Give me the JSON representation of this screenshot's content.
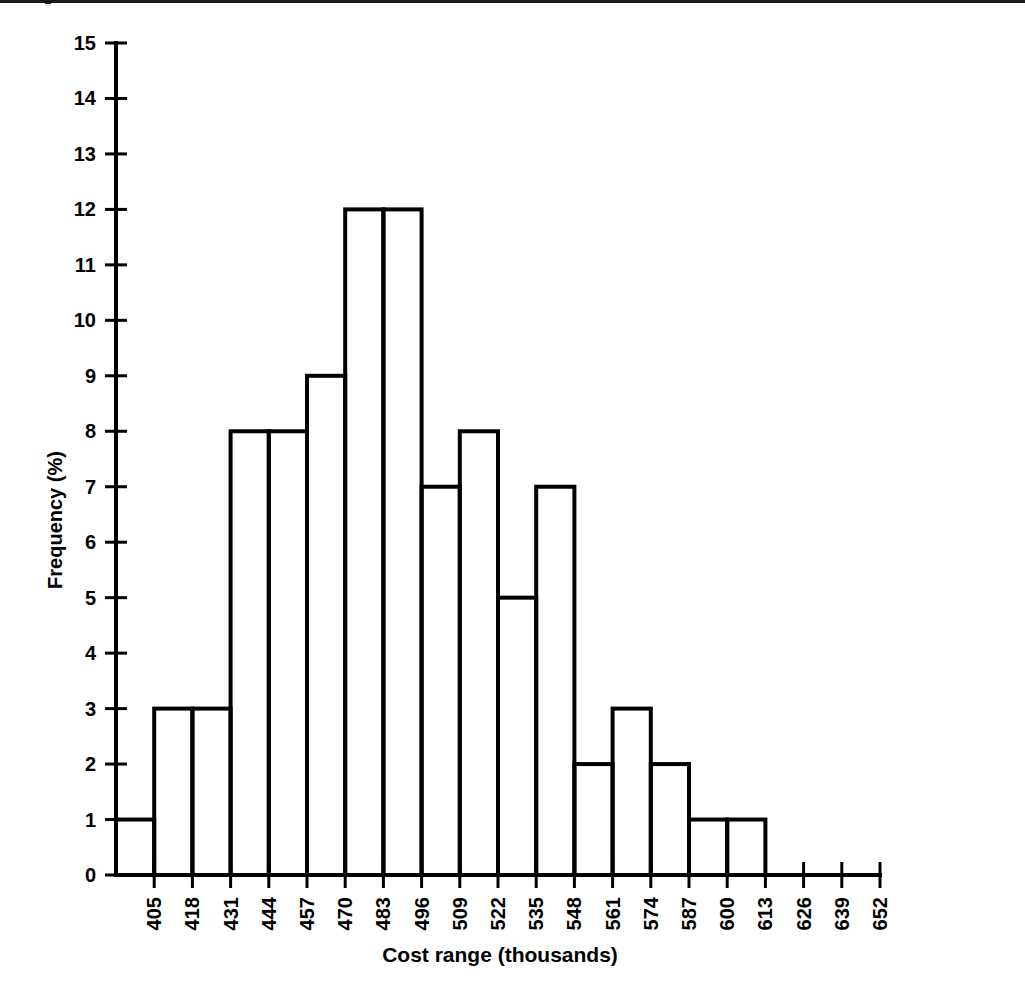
{
  "chart_data": {
    "type": "bar",
    "title": "",
    "xlabel": "Cost range  (thousands)",
    "ylabel": "Frequency (%)",
    "ylim": [
      0,
      15
    ],
    "ytick_labels": [
      "0",
      "1",
      "2",
      "3",
      "4",
      "5",
      "6",
      "7",
      "8",
      "9",
      "10",
      "11",
      "12",
      "13",
      "14",
      "15"
    ],
    "ytick_values": [
      0,
      1,
      2,
      3,
      4,
      5,
      6,
      7,
      8,
      9,
      10,
      11,
      12,
      13,
      14,
      15
    ],
    "xtick_labels": [
      "405",
      "418",
      "431",
      "444",
      "457",
      "470",
      "483",
      "496",
      "509",
      "522",
      "535",
      "548",
      "561",
      "574",
      "587",
      "600",
      "613",
      "626",
      "639",
      "652"
    ],
    "xtick_values": [
      405,
      418,
      431,
      444,
      457,
      470,
      483,
      496,
      509,
      522,
      535,
      548,
      561,
      574,
      587,
      600,
      613,
      626,
      639,
      652
    ],
    "bin_width": 13,
    "bin_edges": [
      392,
      405,
      418,
      431,
      444,
      457,
      470,
      483,
      496,
      509,
      522,
      535,
      548,
      561,
      574,
      587,
      600,
      613,
      626,
      639,
      652
    ],
    "categories": [
      "392-405",
      "405-418",
      "418-431",
      "431-444",
      "444-457",
      "457-470",
      "470-483",
      "483-496",
      "496-509",
      "509-522",
      "522-535",
      "535-548",
      "548-561",
      "561-574",
      "574-587",
      "587-600",
      "600-613",
      "613-626",
      "626-639",
      "639-652"
    ],
    "values": [
      1,
      3,
      3,
      8,
      8,
      9,
      12,
      12,
      7,
      8,
      5,
      7,
      2,
      3,
      2,
      1,
      1,
      0,
      0,
      0
    ],
    "grid": false,
    "legend": false,
    "bar_fill": "#ffffff",
    "bar_stroke": "#000000",
    "axis_color": "#000000"
  },
  "figure": {
    "background": "#ffffff"
  }
}
